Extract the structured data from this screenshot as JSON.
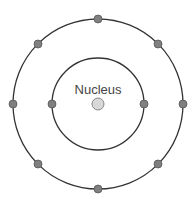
{
  "diagram": {
    "nucleus": {
      "label": "Nucleus",
      "cx": 98,
      "cy": 104,
      "r": 6,
      "fill": "#d8d8d8",
      "stroke": "#707070"
    },
    "shells": [
      {
        "name": "inner-shell",
        "r": 46,
        "electrons": [
          [
            52,
            104
          ],
          [
            144,
            104
          ]
        ]
      },
      {
        "name": "outer-shell",
        "r": 85,
        "electrons": [
          [
            98,
            19
          ],
          [
            158,
            44
          ],
          [
            183,
            104
          ],
          [
            158,
            164
          ],
          [
            98,
            189
          ],
          [
            38,
            164
          ],
          [
            13,
            104
          ],
          [
            38,
            44
          ]
        ]
      }
    ],
    "colors": {
      "orbit": "#333333",
      "electron_fill": "#808080",
      "electron_stroke": "#555555"
    }
  }
}
